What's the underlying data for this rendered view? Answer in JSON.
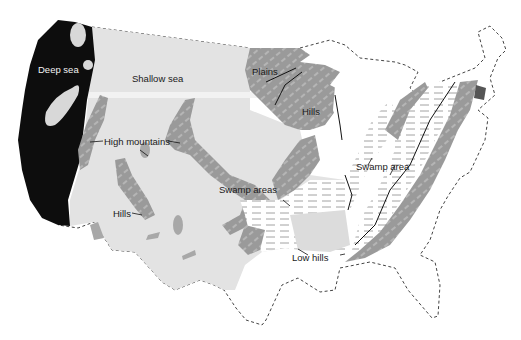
{
  "map": {
    "title": "",
    "colors": {
      "deep_sea": "#0d0d0d",
      "shallow_sea": "#e3e3e3",
      "land_hills": "#9a9a9a",
      "land_light": "#c4c4c4",
      "swamp": "#ffffff",
      "boundary": "#444444",
      "background": "#ffffff"
    },
    "labels": {
      "deep_sea": "Deep sea",
      "shallow_sea": "Shallow sea",
      "plains": "Plains",
      "hills_north": "Hills",
      "high_mountains": "High mountains",
      "hills_west": "Hills",
      "swamp_areas": "Swamp areas",
      "swamp_area": "Swamp area",
      "low_hills": "Low hills"
    },
    "legend_regions": [
      {
        "name": "Deep sea",
        "shade": "black"
      },
      {
        "name": "Shallow sea",
        "shade": "light gray"
      },
      {
        "name": "Hills / High mountains / Plains",
        "shade": "medium gray"
      },
      {
        "name": "Swamp areas",
        "shade": "white with dashes"
      }
    ]
  }
}
